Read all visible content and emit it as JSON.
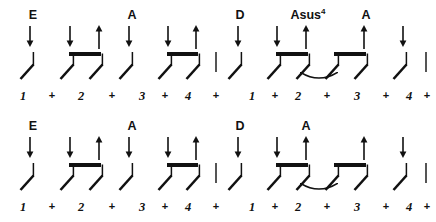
{
  "document": {
    "kind": "guitar-strumming-pattern",
    "width": 436,
    "height": 222,
    "background": "#ffffff",
    "ink": "#111111",
    "barline_color": "#555555"
  },
  "systems": [
    {
      "name": "system-1",
      "top": 0,
      "chords": [
        {
          "label": "E",
          "sup": "",
          "x": 33,
          "y": 9
        },
        {
          "label": "A",
          "sup": "",
          "x": 132,
          "y": 9
        },
        {
          "label": "D",
          "sup": "",
          "x": 240,
          "y": 9
        },
        {
          "label": "Asus",
          "sup": "4",
          "x": 308,
          "y": 9
        },
        {
          "label": "A",
          "sup": "",
          "x": 366,
          "y": 9
        }
      ],
      "arrows": [
        {
          "x": 30,
          "y": 26,
          "dir": "down",
          "len": 21
        },
        {
          "x": 70,
          "y": 26,
          "dir": "down",
          "len": 21
        },
        {
          "x": 99,
          "y": 25,
          "dir": "up",
          "len": 24
        },
        {
          "x": 129,
          "y": 26,
          "dir": "down",
          "len": 21
        },
        {
          "x": 168,
          "y": 26,
          "dir": "down",
          "len": 21
        },
        {
          "x": 196,
          "y": 25,
          "dir": "up",
          "len": 24
        },
        {
          "x": 238,
          "y": 26,
          "dir": "down",
          "len": 21
        },
        {
          "x": 277,
          "y": 26,
          "dir": "down",
          "len": 21
        },
        {
          "x": 306,
          "y": 25,
          "dir": "up",
          "len": 24
        },
        {
          "x": 364,
          "y": 25,
          "dir": "up",
          "len": 24
        },
        {
          "x": 403,
          "y": 26,
          "dir": "down",
          "len": 21
        }
      ],
      "strums": [
        {
          "x": 30,
          "y": 52,
          "stem": "long"
        },
        {
          "x": 70,
          "y": 52,
          "stem": "short"
        },
        {
          "x": 99,
          "y": 52,
          "stem": "short"
        },
        {
          "x": 129,
          "y": 52,
          "stem": "long"
        },
        {
          "x": 168,
          "y": 52,
          "stem": "short"
        },
        {
          "x": 196,
          "y": 52,
          "stem": "short"
        },
        {
          "x": 238,
          "y": 52,
          "stem": "long"
        },
        {
          "x": 277,
          "y": 52,
          "stem": "short"
        },
        {
          "x": 306,
          "y": 52,
          "stem": "short"
        },
        {
          "x": 335,
          "y": 52,
          "stem": "short"
        },
        {
          "x": 364,
          "y": 52,
          "stem": "short"
        },
        {
          "x": 403,
          "y": 52,
          "stem": "long"
        }
      ],
      "beams": [
        {
          "x": 70,
          "y": 52,
          "w": 32,
          "h": 3.6
        },
        {
          "x": 168,
          "y": 52,
          "w": 31,
          "h": 3.6
        },
        {
          "x": 277,
          "y": 52,
          "w": 32,
          "h": 3.6
        },
        {
          "x": 335,
          "y": 52,
          "w": 32,
          "h": 3.6
        }
      ],
      "ties": [
        {
          "x": 300,
          "y": 71,
          "w": 38,
          "h": 9
        }
      ],
      "barlines": [
        {
          "x": 215,
          "y": 52,
          "h": 20
        },
        {
          "x": 425,
          "y": 52,
          "h": 20
        }
      ],
      "counts": [
        {
          "text": "1",
          "x": 23,
          "y": 90,
          "kind": "beat"
        },
        {
          "text": "+",
          "x": 52,
          "y": 90,
          "kind": "and"
        },
        {
          "text": "2",
          "x": 81,
          "y": 90,
          "kind": "beat"
        },
        {
          "text": "+",
          "x": 112,
          "y": 90,
          "kind": "and"
        },
        {
          "text": "3",
          "x": 142,
          "y": 90,
          "kind": "beat"
        },
        {
          "text": "+",
          "x": 165,
          "y": 90,
          "kind": "and"
        },
        {
          "text": "4",
          "x": 188,
          "y": 90,
          "kind": "beat"
        },
        {
          "text": "+",
          "x": 216,
          "y": 90,
          "kind": "and"
        },
        {
          "text": "1",
          "x": 252,
          "y": 90,
          "kind": "beat"
        },
        {
          "text": "+",
          "x": 275,
          "y": 90,
          "kind": "and"
        },
        {
          "text": "2",
          "x": 298,
          "y": 90,
          "kind": "beat"
        },
        {
          "text": "+",
          "x": 327,
          "y": 90,
          "kind": "and"
        },
        {
          "text": "3",
          "x": 357,
          "y": 90,
          "kind": "beat"
        },
        {
          "text": "+",
          "x": 386,
          "y": 90,
          "kind": "and"
        },
        {
          "text": "4",
          "x": 409,
          "y": 90,
          "kind": "beat"
        },
        {
          "text": "+",
          "x": 427,
          "y": 90,
          "kind": "and"
        }
      ]
    },
    {
      "name": "system-2",
      "top": 111,
      "chords": [
        {
          "label": "E",
          "sup": "",
          "x": 33,
          "y": 9
        },
        {
          "label": "A",
          "sup": "",
          "x": 132,
          "y": 9
        },
        {
          "label": "D",
          "sup": "",
          "x": 240,
          "y": 9
        },
        {
          "label": "A",
          "sup": "",
          "x": 306,
          "y": 9
        }
      ],
      "arrows": [
        {
          "x": 30,
          "y": 26,
          "dir": "down",
          "len": 21
        },
        {
          "x": 70,
          "y": 26,
          "dir": "down",
          "len": 21
        },
        {
          "x": 99,
          "y": 25,
          "dir": "up",
          "len": 24
        },
        {
          "x": 129,
          "y": 26,
          "dir": "down",
          "len": 21
        },
        {
          "x": 168,
          "y": 26,
          "dir": "down",
          "len": 21
        },
        {
          "x": 196,
          "y": 25,
          "dir": "up",
          "len": 24
        },
        {
          "x": 238,
          "y": 26,
          "dir": "down",
          "len": 21
        },
        {
          "x": 277,
          "y": 26,
          "dir": "down",
          "len": 21
        },
        {
          "x": 306,
          "y": 25,
          "dir": "up",
          "len": 24
        },
        {
          "x": 364,
          "y": 25,
          "dir": "up",
          "len": 24
        },
        {
          "x": 403,
          "y": 26,
          "dir": "down",
          "len": 21
        }
      ],
      "strums": [
        {
          "x": 30,
          "y": 52,
          "stem": "long"
        },
        {
          "x": 70,
          "y": 52,
          "stem": "short"
        },
        {
          "x": 99,
          "y": 52,
          "stem": "short"
        },
        {
          "x": 129,
          "y": 52,
          "stem": "long"
        },
        {
          "x": 168,
          "y": 52,
          "stem": "short"
        },
        {
          "x": 196,
          "y": 52,
          "stem": "short"
        },
        {
          "x": 238,
          "y": 52,
          "stem": "long"
        },
        {
          "x": 277,
          "y": 52,
          "stem": "short"
        },
        {
          "x": 306,
          "y": 52,
          "stem": "short"
        },
        {
          "x": 335,
          "y": 52,
          "stem": "short"
        },
        {
          "x": 364,
          "y": 52,
          "stem": "short"
        },
        {
          "x": 403,
          "y": 52,
          "stem": "long"
        }
      ],
      "beams": [
        {
          "x": 70,
          "y": 52,
          "w": 32,
          "h": 3.6
        },
        {
          "x": 168,
          "y": 52,
          "w": 31,
          "h": 3.6
        },
        {
          "x": 277,
          "y": 52,
          "w": 32,
          "h": 3.6
        },
        {
          "x": 335,
          "y": 52,
          "w": 32,
          "h": 3.6
        }
      ],
      "ties": [
        {
          "x": 300,
          "y": 71,
          "w": 38,
          "h": 9
        }
      ],
      "barlines": [
        {
          "x": 215,
          "y": 52,
          "h": 20
        },
        {
          "x": 425,
          "y": 52,
          "h": 20
        }
      ],
      "counts": [
        {
          "text": "1",
          "x": 23,
          "y": 90,
          "kind": "beat"
        },
        {
          "text": "+",
          "x": 52,
          "y": 90,
          "kind": "and"
        },
        {
          "text": "2",
          "x": 81,
          "y": 90,
          "kind": "beat"
        },
        {
          "text": "+",
          "x": 112,
          "y": 90,
          "kind": "and"
        },
        {
          "text": "3",
          "x": 142,
          "y": 90,
          "kind": "beat"
        },
        {
          "text": "+",
          "x": 165,
          "y": 90,
          "kind": "and"
        },
        {
          "text": "4",
          "x": 188,
          "y": 90,
          "kind": "beat"
        },
        {
          "text": "+",
          "x": 216,
          "y": 90,
          "kind": "and"
        },
        {
          "text": "1",
          "x": 252,
          "y": 90,
          "kind": "beat"
        },
        {
          "text": "+",
          "x": 275,
          "y": 90,
          "kind": "and"
        },
        {
          "text": "2",
          "x": 298,
          "y": 90,
          "kind": "beat"
        },
        {
          "text": "+",
          "x": 327,
          "y": 90,
          "kind": "and"
        },
        {
          "text": "3",
          "x": 357,
          "y": 90,
          "kind": "beat"
        },
        {
          "text": "+",
          "x": 386,
          "y": 90,
          "kind": "and"
        },
        {
          "text": "4",
          "x": 409,
          "y": 90,
          "kind": "beat"
        },
        {
          "text": "+",
          "x": 427,
          "y": 90,
          "kind": "and"
        }
      ]
    }
  ]
}
